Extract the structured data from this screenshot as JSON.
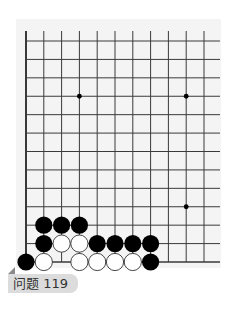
{
  "puzzle": {
    "label": "问题 119"
  },
  "board": {
    "columns_visible": 11,
    "rows_visible": 13,
    "edges": [
      "left",
      "bottom"
    ],
    "star_points": [
      {
        "col": 3,
        "row": 9
      },
      {
        "col": 9,
        "row": 9
      },
      {
        "col": 9,
        "row": 3
      }
    ],
    "stones": [
      {
        "color": "black",
        "col": 1,
        "row": 2
      },
      {
        "color": "black",
        "col": 2,
        "row": 2
      },
      {
        "color": "black",
        "col": 3,
        "row": 2
      },
      {
        "color": "black",
        "col": 1,
        "row": 1
      },
      {
        "color": "white",
        "col": 2,
        "row": 1
      },
      {
        "color": "white",
        "col": 3,
        "row": 1
      },
      {
        "color": "black",
        "col": 4,
        "row": 1
      },
      {
        "color": "black",
        "col": 5,
        "row": 1
      },
      {
        "color": "black",
        "col": 6,
        "row": 1
      },
      {
        "color": "black",
        "col": 7,
        "row": 1
      },
      {
        "color": "black",
        "col": 0,
        "row": 0
      },
      {
        "color": "white",
        "col": 1,
        "row": 0
      },
      {
        "color": "white",
        "col": 3,
        "row": 0
      },
      {
        "color": "white",
        "col": 4,
        "row": 0
      },
      {
        "color": "white",
        "col": 5,
        "row": 0
      },
      {
        "color": "white",
        "col": 6,
        "row": 0
      },
      {
        "color": "black",
        "col": 7,
        "row": 0
      }
    ],
    "colors": {
      "line": "#3a3a3a",
      "black_stone": "#000000",
      "white_stone": "#ffffff",
      "star": "#000000"
    }
  }
}
